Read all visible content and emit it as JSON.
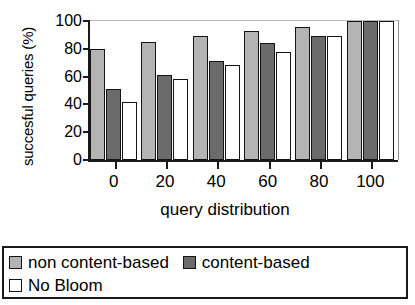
{
  "chart_data": {
    "type": "bar",
    "title": "",
    "xlabel": "query distribution",
    "ylabel": "succesful queries (%)",
    "categories": [
      "0",
      "20",
      "40",
      "60",
      "80",
      "100"
    ],
    "ylim": [
      0,
      100
    ],
    "yticks": [
      0,
      20,
      40,
      60,
      80,
      100
    ],
    "grid": false,
    "legend_position": "bottom",
    "series": [
      {
        "name": "non content-based",
        "color": "#b4b4b4",
        "values": [
          80,
          85,
          89,
          93,
          96,
          100
        ]
      },
      {
        "name": "content-based",
        "color": "#6b6b6b",
        "values": [
          51,
          61,
          71,
          84,
          89,
          100
        ]
      },
      {
        "name": "No Bloom",
        "color": "#ffffff",
        "values": [
          42,
          58,
          68,
          78,
          89,
          100
        ]
      }
    ]
  }
}
